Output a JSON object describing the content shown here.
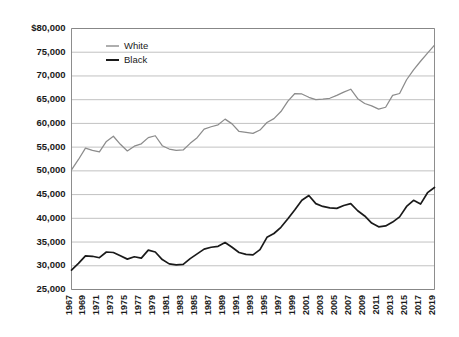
{
  "chart_data": {
    "type": "line",
    "title": "",
    "xlabel": "",
    "ylabel": "",
    "ylim": [
      25000,
      80000
    ],
    "ytick_step": 5000,
    "grid": true,
    "legend_position": "top-left-inside",
    "ytick_labels": [
      "$80,000",
      "75,000",
      "70,000",
      "65,000",
      "60,000",
      "55,000",
      "50,000",
      "45,000",
      "40,000",
      "35,000",
      "30,000",
      "25,000"
    ],
    "ytick_values": [
      80000,
      75000,
      70000,
      65000,
      60000,
      55000,
      50000,
      45000,
      40000,
      35000,
      30000,
      25000
    ],
    "xtick_labels": [
      "1967",
      "1969",
      "1971",
      "1973",
      "1975",
      "1977",
      "1979",
      "1981",
      "1983",
      "1985",
      "1987",
      "1989",
      "1991",
      "1993",
      "1995",
      "1997",
      "1999",
      "2001",
      "2003",
      "2005",
      "2007",
      "2009",
      "2011",
      "2013",
      "2015",
      "2017",
      "2019"
    ],
    "x": [
      1967,
      1968,
      1969,
      1970,
      1971,
      1972,
      1973,
      1974,
      1975,
      1976,
      1977,
      1978,
      1979,
      1980,
      1981,
      1982,
      1983,
      1984,
      1985,
      1986,
      1987,
      1988,
      1989,
      1990,
      1991,
      1992,
      1993,
      1994,
      1995,
      1996,
      1997,
      1998,
      1999,
      2000,
      2001,
      2002,
      2003,
      2004,
      2005,
      2006,
      2007,
      2008,
      2009,
      2010,
      2011,
      2012,
      2013,
      2014,
      2015,
      2016,
      2017,
      2018,
      2019
    ],
    "colors": {
      "White": "#8c8c8c",
      "Black": "#1a1a1a"
    },
    "series": [
      {
        "name": "White",
        "color": "#8c8c8c",
        "values": [
          50200,
          52400,
          54800,
          54300,
          54000,
          56200,
          57300,
          55600,
          54200,
          55200,
          55700,
          57000,
          57400,
          55300,
          54600,
          54300,
          54400,
          55800,
          57000,
          58800,
          59300,
          59700,
          60900,
          59900,
          58300,
          58100,
          57900,
          58600,
          60200,
          61000,
          62500,
          64700,
          66300,
          66200,
          65500,
          65000,
          65100,
          65300,
          65900,
          66600,
          67200,
          65200,
          64200,
          63700,
          63000,
          63400,
          65900,
          66300,
          69200,
          71300,
          73100,
          74800,
          76500
        ]
      },
      {
        "name": "Black",
        "color": "#1a1a1a",
        "values": [
          29100,
          30500,
          32100,
          32000,
          31700,
          32900,
          32800,
          32100,
          31400,
          31900,
          31600,
          33300,
          32900,
          31300,
          30400,
          30200,
          30300,
          31500,
          32500,
          33500,
          33900,
          34100,
          34900,
          33900,
          32800,
          32400,
          32300,
          33400,
          36000,
          36800,
          38100,
          39900,
          41800,
          43800,
          44800,
          43100,
          42500,
          42200,
          42100,
          42700,
          43100,
          41600,
          40500,
          39000,
          38200,
          38400,
          39200,
          40300,
          42500,
          43800,
          43000,
          45400,
          46500
        ]
      }
    ]
  },
  "legend": {
    "items": [
      {
        "label": "White"
      },
      {
        "label": "Black"
      }
    ]
  }
}
